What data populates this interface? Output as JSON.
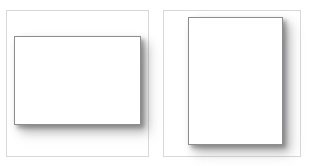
{
  "figure": {
    "background_color": "#ffffff",
    "width": 313,
    "height": 166,
    "frame_border_color": "#d8d8da",
    "sheet_border_color": "#8d8d91",
    "sheet_fill_color": "#ffffff",
    "shadow_color": "#3c3c3e",
    "panels": [
      {
        "id": "panel-left",
        "name": "landscape-panel",
        "orientation": "landscape",
        "frame": {
          "x": 6,
          "y": 10,
          "width": 143,
          "height": 147
        },
        "sheet": {
          "x": 14,
          "y": 36,
          "width": 127,
          "height": 89
        },
        "caption": ""
      },
      {
        "id": "panel-right",
        "name": "portrait-panel",
        "orientation": "portrait",
        "frame": {
          "x": 163,
          "y": 10,
          "width": 138,
          "height": 147
        },
        "sheet": {
          "x": 188,
          "y": 17,
          "width": 95,
          "height": 128
        },
        "caption": ""
      }
    ]
  }
}
